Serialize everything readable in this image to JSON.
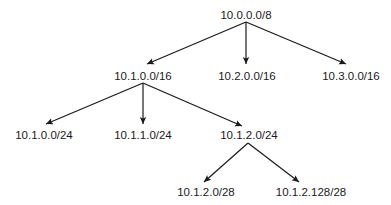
{
  "diagram": {
    "type": "tree",
    "title": "",
    "nodes": [
      {
        "id": "n0",
        "label": "10.0.0.0/8",
        "x": 246,
        "y": 19
      },
      {
        "id": "n1",
        "label": "10.1.0.0/16",
        "x": 143,
        "y": 80
      },
      {
        "id": "n2",
        "label": "10.2.0.0/16",
        "x": 247,
        "y": 80
      },
      {
        "id": "n3",
        "label": "10.3.0.0/16",
        "x": 351,
        "y": 80
      },
      {
        "id": "n4",
        "label": "10.1.0.0/24",
        "x": 44,
        "y": 139
      },
      {
        "id": "n5",
        "label": "10.1.1.0/24",
        "x": 143,
        "y": 139
      },
      {
        "id": "n6",
        "label": "10.1.2.0/24",
        "x": 249,
        "y": 139
      },
      {
        "id": "n7",
        "label": "10.1.2.0/28",
        "x": 206,
        "y": 196
      },
      {
        "id": "n8",
        "label": "10.1.2.128/28",
        "x": 311,
        "y": 196
      }
    ],
    "edges": [
      {
        "from": "n0",
        "to": "n1",
        "x1": 246,
        "y1": 22,
        "x2": 147,
        "y2": 64
      },
      {
        "from": "n0",
        "to": "n2",
        "x1": 246,
        "y1": 22,
        "x2": 246,
        "y2": 64
      },
      {
        "from": "n0",
        "to": "n3",
        "x1": 246,
        "y1": 22,
        "x2": 346,
        "y2": 64
      },
      {
        "from": "n1",
        "to": "n4",
        "x1": 143,
        "y1": 83,
        "x2": 46,
        "y2": 124
      },
      {
        "from": "n1",
        "to": "n5",
        "x1": 143,
        "y1": 83,
        "x2": 143,
        "y2": 124
      },
      {
        "from": "n1",
        "to": "n6",
        "x1": 143,
        "y1": 83,
        "x2": 242,
        "y2": 126
      },
      {
        "from": "n6",
        "to": "n7",
        "x1": 248,
        "y1": 143,
        "x2": 204,
        "y2": 182
      },
      {
        "from": "n6",
        "to": "n8",
        "x1": 248,
        "y1": 143,
        "x2": 299,
        "y2": 182
      }
    ],
    "colors": {
      "line": "#1a1a1a",
      "text": "#1a1a1a",
      "background": "#ffffff"
    }
  }
}
